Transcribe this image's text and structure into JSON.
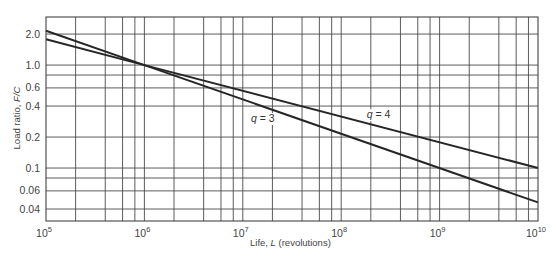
{
  "chart_data": {
    "type": "line",
    "title": "",
    "xlabel": "Life, L (revolutions)",
    "xlabel_parts": {
      "prefix": "Life, ",
      "var": "L",
      "suffix": " (revolutions)"
    },
    "ylabel": "Load ratio, F/C",
    "ylabel_parts": {
      "prefix": "Load ratio, ",
      "var": "F/C"
    },
    "x_scale": "log",
    "y_scale": "log",
    "xlim": [
      100000,
      10000000000
    ],
    "ylim": [
      0.0306,
      2.93
    ],
    "grid": true,
    "x_ticks": [
      {
        "value": 100000,
        "base": "10",
        "exp": "5"
      },
      {
        "value": 1000000,
        "base": "10",
        "exp": "6"
      },
      {
        "value": 10000000,
        "base": "10",
        "exp": "7"
      },
      {
        "value": 100000000,
        "base": "10",
        "exp": "8"
      },
      {
        "value": 1000000000,
        "base": "10",
        "exp": "9"
      },
      {
        "value": 10000000000,
        "base": "10",
        "exp": "10"
      }
    ],
    "x_minor_multipliers": [
      2,
      4,
      6,
      8
    ],
    "y_ticks": [
      {
        "value": 2.0,
        "label": "2.0"
      },
      {
        "value": 1.0,
        "label": "1.0"
      },
      {
        "value": 0.6,
        "label": "0.6"
      },
      {
        "value": 0.4,
        "label": "0.4"
      },
      {
        "value": 0.2,
        "label": "0.2"
      },
      {
        "value": 0.1,
        "label": "0.1"
      },
      {
        "value": 0.06,
        "label": "0.06"
      },
      {
        "value": 0.04,
        "label": "0.04"
      }
    ],
    "y_gridlines": [
      2.0,
      1.0,
      0.8,
      0.6,
      0.4,
      0.2,
      0.1,
      0.08,
      0.06,
      0.04
    ],
    "series": [
      {
        "name": "q = 3",
        "label_var": "q",
        "label_value": "3",
        "exponent": 3,
        "x": [
          100000,
          1000000,
          10000000000
        ],
        "y": [
          2.154,
          1.0,
          0.0464
        ],
        "label_at": {
          "x": 16000000,
          "y": 0.28
        }
      },
      {
        "name": "q = 4",
        "label_var": "q",
        "label_value": "4",
        "exponent": 4,
        "x": [
          100000,
          1000000,
          10000000000
        ],
        "y": [
          1.778,
          1.0,
          0.1
        ],
        "label_at": {
          "x": 240000000,
          "y": 0.305
        }
      }
    ]
  }
}
